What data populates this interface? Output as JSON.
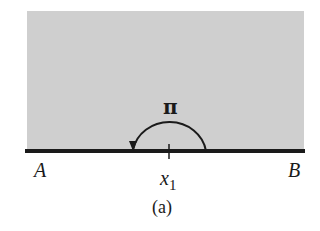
{
  "figure": {
    "caption": "(a)",
    "left_label": "A",
    "right_label": "B",
    "point_label": "x",
    "point_subscript": "1",
    "arc_label": "π",
    "shade_color": "#cfcfcf",
    "line_color": "#1a1a1a"
  }
}
